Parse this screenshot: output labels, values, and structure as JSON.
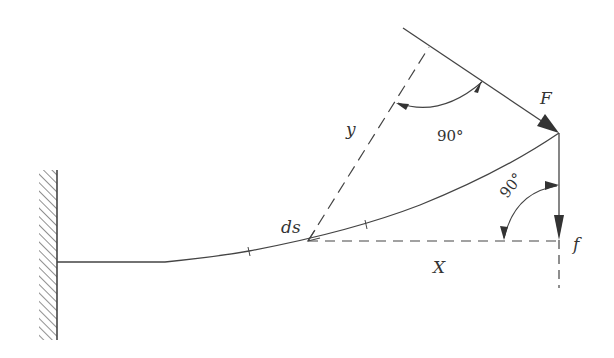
{
  "diagram": {
    "type": "cantilever-beam-force-diagram",
    "colors": {
      "line": "#444444",
      "text": "#333333",
      "background": "#ffffff"
    },
    "labels": {
      "force": "F",
      "force_component": "f",
      "element": "ds",
      "perpendicular_distance": "y",
      "horizontal_distance": "X",
      "angle_top": "90°",
      "angle_right": "90°"
    },
    "elements": [
      {
        "name": "fixed-wall",
        "description": "hatched fixed support on left"
      },
      {
        "name": "deflected-beam",
        "description": "curved cantilever beam from wall to load point"
      },
      {
        "name": "force-F",
        "description": "inclined force arrow at beam tip"
      },
      {
        "name": "force-f",
        "description": "vertical downward force arrow at beam tip"
      },
      {
        "name": "lever-arm-y",
        "description": "dashed line perpendicular to F from ds"
      },
      {
        "name": "lever-arm-X",
        "description": "horizontal dashed line from ds to f line"
      }
    ]
  }
}
